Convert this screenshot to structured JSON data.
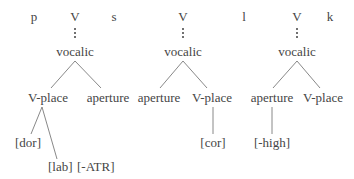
{
  "diagram": {
    "type": "feature-geometry-trees",
    "line_color": "#777777",
    "text_color": "#454545",
    "trees": [
      {
        "segments": [
          "p",
          "V",
          "s"
        ],
        "root": "vocalic",
        "children": [
          "V-place",
          "aperture"
        ],
        "v_place_dependents": [
          "[dor]",
          "[lab]"
        ],
        "aperture_dependent": "[-ATR]"
      },
      {
        "segments": [
          "V"
        ],
        "root": "vocalic",
        "children": [
          "aperture",
          "V-place"
        ],
        "v_place_dependents": [
          "[cor]"
        ]
      },
      {
        "segments": [
          "l",
          "V",
          "k"
        ],
        "root": "vocalic",
        "children": [
          "aperture",
          "V-place"
        ],
        "aperture_dependent": "[-high]"
      }
    ]
  }
}
